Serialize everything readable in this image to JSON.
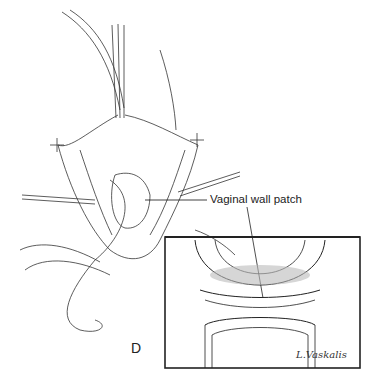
{
  "figure": {
    "panel_letter": "D",
    "callout_label": "Vaginal wall patch",
    "signature": "L.Vaskalis",
    "colors": {
      "line": "#222222",
      "shade": "#9a9a9a",
      "background": "#ffffff"
    }
  }
}
